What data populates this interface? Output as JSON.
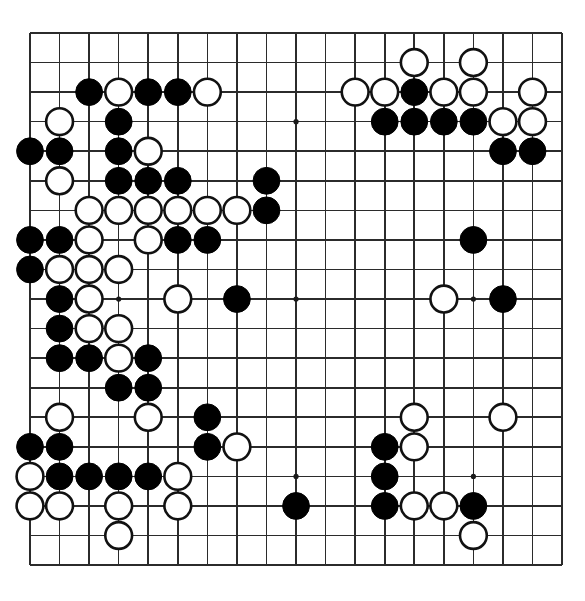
{
  "board": {
    "title": "Go board position",
    "size": 19,
    "origin_x": 30,
    "origin_y": 33,
    "spacing": 29.56,
    "stone_radius": 13.4,
    "star_radius": 2.6,
    "colors": {
      "background": "#ffffff",
      "line": "#2b2b2b",
      "black_stone": "#000000",
      "white_stone": "#ffffff",
      "white_stone_outline": "#111111"
    },
    "star_points": [
      [
        4,
        4
      ],
      [
        10,
        4
      ],
      [
        16,
        4
      ],
      [
        4,
        10
      ],
      [
        10,
        10
      ],
      [
        16,
        10
      ],
      [
        4,
        16
      ],
      [
        10,
        16
      ],
      [
        16,
        16
      ]
    ],
    "black_stones": [
      [
        3,
        3
      ],
      [
        5,
        3
      ],
      [
        6,
        3
      ],
      [
        14,
        3
      ],
      [
        4,
        4
      ],
      [
        13,
        4
      ],
      [
        14,
        4
      ],
      [
        15,
        4
      ],
      [
        16,
        4
      ],
      [
        1,
        5
      ],
      [
        2,
        5
      ],
      [
        4,
        5
      ],
      [
        17,
        5
      ],
      [
        18,
        5
      ],
      [
        4,
        6
      ],
      [
        5,
        6
      ],
      [
        6,
        6
      ],
      [
        9,
        6
      ],
      [
        9,
        7
      ],
      [
        1,
        8
      ],
      [
        2,
        8
      ],
      [
        6,
        8
      ],
      [
        7,
        8
      ],
      [
        16,
        8
      ],
      [
        1,
        9
      ],
      [
        2,
        10
      ],
      [
        8,
        10
      ],
      [
        17,
        10
      ],
      [
        2,
        11
      ],
      [
        2,
        12
      ],
      [
        3,
        12
      ],
      [
        5,
        12
      ],
      [
        4,
        13
      ],
      [
        5,
        13
      ],
      [
        7,
        14
      ],
      [
        1,
        15
      ],
      [
        2,
        15
      ],
      [
        7,
        15
      ],
      [
        13,
        15
      ],
      [
        2,
        16
      ],
      [
        3,
        16
      ],
      [
        4,
        16
      ],
      [
        5,
        16
      ],
      [
        13,
        16
      ],
      [
        10,
        17
      ],
      [
        13,
        17
      ],
      [
        16,
        17
      ]
    ],
    "white_stones": [
      [
        14,
        2
      ],
      [
        16,
        2
      ],
      [
        4,
        3
      ],
      [
        7,
        3
      ],
      [
        12,
        3
      ],
      [
        13,
        3
      ],
      [
        15,
        3
      ],
      [
        16,
        3
      ],
      [
        18,
        3
      ],
      [
        2,
        4
      ],
      [
        17,
        4
      ],
      [
        18,
        4
      ],
      [
        5,
        5
      ],
      [
        2,
        6
      ],
      [
        3,
        7
      ],
      [
        4,
        7
      ],
      [
        5,
        7
      ],
      [
        6,
        7
      ],
      [
        7,
        7
      ],
      [
        8,
        7
      ],
      [
        3,
        8
      ],
      [
        5,
        8
      ],
      [
        2,
        9
      ],
      [
        3,
        9
      ],
      [
        4,
        9
      ],
      [
        3,
        10
      ],
      [
        6,
        10
      ],
      [
        15,
        10
      ],
      [
        3,
        11
      ],
      [
        4,
        11
      ],
      [
        4,
        12
      ],
      [
        2,
        14
      ],
      [
        5,
        14
      ],
      [
        14,
        14
      ],
      [
        17,
        14
      ],
      [
        8,
        15
      ],
      [
        14,
        15
      ],
      [
        1,
        16
      ],
      [
        6,
        16
      ],
      [
        1,
        17
      ],
      [
        2,
        17
      ],
      [
        4,
        17
      ],
      [
        6,
        17
      ],
      [
        14,
        17
      ],
      [
        15,
        17
      ],
      [
        4,
        18
      ],
      [
        16,
        18
      ]
    ]
  }
}
